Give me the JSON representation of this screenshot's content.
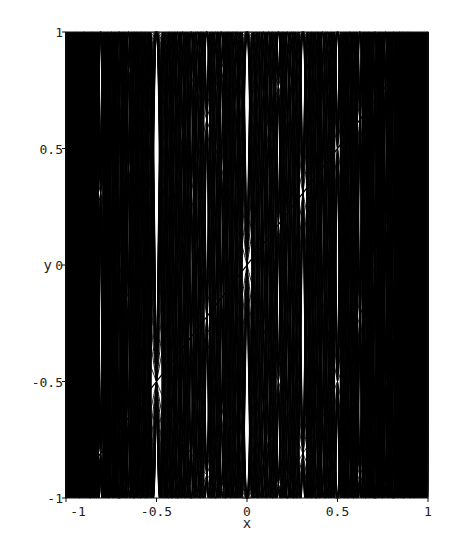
{
  "chart_data": {
    "type": "line",
    "title": "",
    "xlabel": "x",
    "ylabel": "y",
    "xlim": [
      -1,
      1
    ],
    "ylim": [
      -1,
      1
    ],
    "x_ticks": [
      -1,
      -0.5,
      0,
      0.5,
      1
    ],
    "x_tick_labels": [
      "-1",
      "-0.5",
      "0",
      "0.5",
      "1"
    ],
    "y_ticks": [
      -1,
      -0.5,
      0,
      0.5,
      1
    ],
    "y_tick_labels": [
      "-1",
      "-0.5",
      "0",
      "0.5",
      "1"
    ],
    "grid": false,
    "legend": null,
    "line_color": "#000000",
    "series_degrees_start": 1,
    "series_degrees_end": 60,
    "samples_per_curve": 900,
    "series": [
      {
        "name": "T_1(x) = x",
        "x": [
          -1,
          1
        ],
        "values": [
          -1,
          1
        ]
      }
    ]
  },
  "frame": {
    "left": 66,
    "right": 428,
    "top": 32,
    "bottom": 498
  }
}
